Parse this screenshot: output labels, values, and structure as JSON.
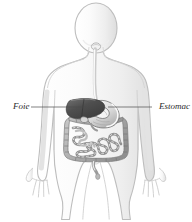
{
  "figure": {
    "background_color": "#ffffff",
    "width": 192,
    "height": 222
  },
  "labels": [
    {
      "id": "foie",
      "text": "Foie",
      "side": "left",
      "color": "#2b2b2b",
      "leader_line": {
        "x1": 31,
        "y1": 107,
        "x2": 86,
        "y2": 107
      }
    },
    {
      "id": "estomac",
      "text": "Estomac",
      "side": "right",
      "color": "#2b2b2b",
      "leader_line": {
        "x1": 108,
        "y1": 107,
        "x2": 152,
        "y2": 107
      }
    }
  ],
  "organs": {
    "liver": {
      "name": "liver",
      "label": "Foie",
      "fill": "#565656"
    },
    "stomach": {
      "name": "stomach",
      "label": "Estomac",
      "fill": "#dcdcdc"
    },
    "esophagus": {
      "name": "esophagus",
      "fill": "#e9e9e9"
    },
    "large_intestine": {
      "name": "large-intestine",
      "fill": "#b8b8b8"
    },
    "small_intestine": {
      "name": "small-intestine",
      "fill": "#cfcfcf"
    },
    "rectum": {
      "name": "rectum",
      "fill": "#c4c4c4"
    }
  },
  "body": {
    "outline_color": "#bdbdbd",
    "fill_color": "#fdfdfd",
    "shade_color": "#ececec"
  }
}
